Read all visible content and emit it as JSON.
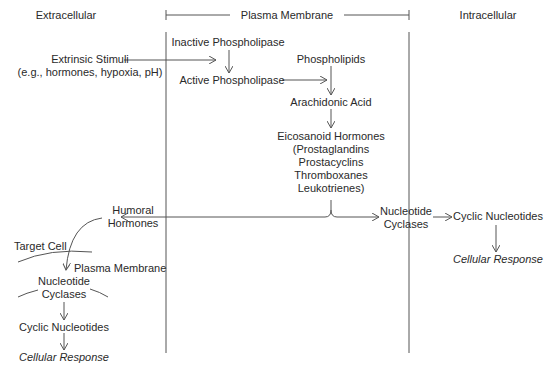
{
  "regions": {
    "extracellular": "Extracellular",
    "plasma_membrane": "Plasma Membrane",
    "intracellular": "Intracellular"
  },
  "nodes": {
    "extrinsic_stimuli": [
      "Extrinsic Stimuli",
      "(e.g., hormones, hypoxia, pH)"
    ],
    "inactive_phospholipase": "Inactive Phospholipase",
    "active_phospholipase": "Active Phospholipase",
    "phospholipids": "Phospholipids",
    "arachidonic_acid": "Arachidonic Acid",
    "eicosanoid_hormones": [
      "Eicosanoid Hormones",
      "(Prostaglandins",
      "Prostacyclins",
      "Thromboxanes",
      "Leukotrienes)"
    ],
    "humoral_hormones": [
      "Humoral",
      "Hormones"
    ],
    "nucleotide_cyclases_right": [
      "Nucleotide",
      "Cyclases"
    ],
    "cyclic_nucleotides_right": "Cyclic Nucleotides",
    "cellular_response_right": "Cellular Response",
    "target_cell": "Target Cell",
    "target_plasma_membrane": "Plasma Membrane",
    "nucleotide_cyclases_left": [
      "Nucleotide",
      "Cyclases"
    ],
    "cyclic_nucleotides_left": "Cyclic Nucleotides",
    "cellular_response_left": "Cellular Response"
  },
  "colors": {
    "line": "#555555",
    "text": "#2a2a2a"
  }
}
